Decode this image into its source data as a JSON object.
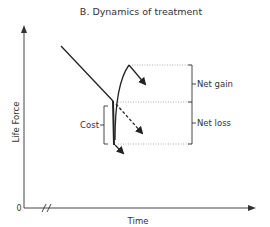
{
  "title": "B.  Dynamics of treatment",
  "axes": {
    "y_label": "Life Force",
    "x_label": "Time",
    "origin_label": "0"
  },
  "annotations": {
    "cost": "Cost",
    "net_gain": "Net gain",
    "net_loss": "Net loss"
  },
  "colors": {
    "line": "#222222",
    "dotted": "#9a9a9a",
    "text": "#333333"
  }
}
